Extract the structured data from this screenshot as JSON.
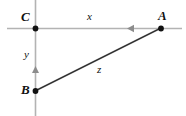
{
  "figure": {
    "type": "geometry-diagram",
    "width": 186,
    "height": 116,
    "background_color": "#ffffff",
    "colors": {
      "axis_line": "#b3b3b3",
      "hypotenuse_line": "#333333",
      "point_fill": "#111111",
      "label_text": "#111111",
      "arrow_fill": "#8c8c8c"
    },
    "points": [
      {
        "id": "C",
        "label": "C",
        "x": 35,
        "y": 28
      },
      {
        "id": "A",
        "label": "A",
        "x": 161,
        "y": 28
      },
      {
        "id": "B",
        "label": "B",
        "x": 35,
        "y": 91
      }
    ],
    "segments": [
      {
        "id": "x",
        "label": "x",
        "from": "C",
        "to": "A",
        "style": "axis"
      },
      {
        "id": "y",
        "label": "y",
        "from": "C",
        "to": "B",
        "style": "axis"
      },
      {
        "id": "z",
        "label": "z",
        "from": "B",
        "to": "A",
        "style": "solid-dark"
      }
    ],
    "labels": {
      "vertex_C": "C",
      "vertex_A": "A",
      "vertex_B": "B",
      "side_x": "x",
      "side_y": "y",
      "side_z": "z"
    },
    "arrows": [
      {
        "id": "horizontal-arrow",
        "direction": "left",
        "x": 131,
        "y": 28
      },
      {
        "id": "vertical-arrow",
        "direction": "up",
        "x": 35,
        "y": 70
      }
    ],
    "axes": {
      "horizontal": {
        "y": 28,
        "x_start": 7,
        "x_end": 182
      },
      "vertical": {
        "x": 35,
        "y_start": 0,
        "y_end": 116
      }
    }
  }
}
